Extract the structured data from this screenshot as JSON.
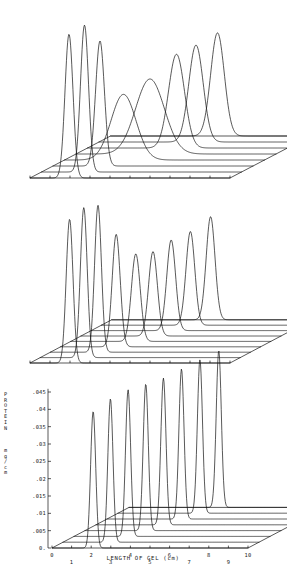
{
  "figure": {
    "background": "#ffffff",
    "line_color": "#111111",
    "panel_count": 3
  },
  "axes": {
    "x_title": "LENGTH OF GEL (cm)",
    "x_ticks": [
      "0",
      "1",
      "2",
      "3",
      "4",
      "5",
      "6",
      "7",
      "8",
      "9",
      "10"
    ],
    "x_range": [
      0,
      10
    ],
    "y_title_top": "PROTEIN",
    "y_title_bottom": "mg/cm",
    "y_title_letters_top": [
      "P",
      "R",
      "O",
      "T",
      "E",
      "I",
      "N"
    ],
    "y_title_letters_bottom": [
      "m",
      "g",
      "/",
      "c",
      "m"
    ],
    "y_ticks": [
      "0.",
      ".005",
      ".01",
      ".015",
      ".02",
      ".025",
      ".03",
      ".035",
      ".04",
      ".045"
    ],
    "y_range": [
      0,
      0.048
    ]
  },
  "chart_data": {
    "type": "line",
    "title": "",
    "subtitle": "",
    "xlabel": "LENGTH OF GEL (cm)",
    "ylabel": "PROTEIN mg/cm",
    "xlim": [
      0,
      10
    ],
    "ylim": [
      0,
      0.048
    ],
    "grid": false,
    "legend": "none",
    "projection": "waterfall-3d-offset-ridgeline",
    "panels": [
      {
        "name": "panel-top",
        "index": 0,
        "trace_count": 8,
        "axis_labels_shown": false,
        "description": "Eight offset profiles; first three sharp narrow peaks near 2.0-2.4 cm, middle traces broad low humps spreading 2.5-5 cm, last four progressively sharper peaks near 4.5-5.6 cm",
        "series": [
          {
            "name": "trace-1",
            "peaks": [
              {
                "x": 1.95,
                "height": 0.046,
                "width": 0.2
              }
            ]
          },
          {
            "name": "trace-2",
            "peaks": [
              {
                "x": 2.15,
                "height": 0.047,
                "width": 0.2
              }
            ]
          },
          {
            "name": "trace-3",
            "peaks": [
              {
                "x": 2.35,
                "height": 0.04,
                "width": 0.22
              }
            ]
          },
          {
            "name": "trace-4",
            "peaks": [
              {
                "x": 2.95,
                "height": 0.021,
                "width": 0.62
              }
            ]
          },
          {
            "name": "trace-5",
            "peaks": [
              {
                "x": 3.7,
                "height": 0.024,
                "width": 0.72
              }
            ]
          },
          {
            "name": "trace-6",
            "peaks": [
              {
                "x": 4.45,
                "height": 0.03,
                "width": 0.4
              }
            ]
          },
          {
            "name": "trace-7",
            "peaks": [
              {
                "x": 4.85,
                "height": 0.031,
                "width": 0.36
              }
            ]
          },
          {
            "name": "trace-8",
            "peaks": [
              {
                "x": 5.35,
                "height": 0.033,
                "width": 0.34
              }
            ]
          }
        ]
      },
      {
        "name": "panel-middle",
        "index": 1,
        "trace_count": 9,
        "axis_labels_shown": false,
        "description": "Nine offset profiles; three tall sharp peaks at 2.0-2.4 cm then descending series of medium peaks from 2.8 to 5.3 cm, each baseline with a step shoulder at the right",
        "series": [
          {
            "name": "trace-1",
            "peaks": [
              {
                "x": 1.98,
                "height": 0.046,
                "width": 0.17
              }
            ]
          },
          {
            "name": "trace-2",
            "peaks": [
              {
                "x": 2.18,
                "height": 0.048,
                "width": 0.17
              }
            ]
          },
          {
            "name": "trace-3",
            "peaks": [
              {
                "x": 2.38,
                "height": 0.047,
                "width": 0.17
              }
            ]
          },
          {
            "name": "trace-4",
            "peaks": [
              {
                "x": 2.78,
                "height": 0.036,
                "width": 0.2
              }
            ]
          },
          {
            "name": "trace-5",
            "peaks": [
              {
                "x": 3.25,
                "height": 0.028,
                "width": 0.22
              }
            ]
          },
          {
            "name": "trace-6",
            "peaks": [
              {
                "x": 3.6,
                "height": 0.027,
                "width": 0.22
              }
            ]
          },
          {
            "name": "trace-7",
            "peaks": [
              {
                "x": 4.0,
                "height": 0.029,
                "width": 0.22
              }
            ]
          },
          {
            "name": "trace-8",
            "peaks": [
              {
                "x": 4.45,
                "height": 0.03,
                "width": 0.22
              }
            ]
          },
          {
            "name": "trace-9",
            "peaks": [
              {
                "x": 4.95,
                "height": 0.033,
                "width": 0.22
              }
            ]
          }
        ]
      },
      {
        "name": "panel-bottom",
        "index": 2,
        "trace_count": 8,
        "axis_labels_shown": true,
        "description": "Eight offset profiles each with a single very sharp tall peak, positions stepping from about 2.1 to 4.6 cm, peak heights rising slightly across the series",
        "series": [
          {
            "name": "trace-1",
            "peaks": [
              {
                "x": 2.1,
                "height": 0.041,
                "width": 0.13
              }
            ]
          },
          {
            "name": "trace-2",
            "peaks": [
              {
                "x": 2.42,
                "height": 0.043,
                "width": 0.13
              }
            ]
          },
          {
            "name": "trace-3",
            "peaks": [
              {
                "x": 2.76,
                "height": 0.044,
                "width": 0.13
              }
            ]
          },
          {
            "name": "trace-4",
            "peaks": [
              {
                "x": 3.1,
                "height": 0.044,
                "width": 0.13
              }
            ]
          },
          {
            "name": "trace-5",
            "peaks": [
              {
                "x": 3.44,
                "height": 0.044,
                "width": 0.13
              }
            ]
          },
          {
            "name": "trace-6",
            "peaks": [
              {
                "x": 3.8,
                "height": 0.045,
                "width": 0.13
              }
            ]
          },
          {
            "name": "trace-7",
            "peaks": [
              {
                "x": 4.18,
                "height": 0.046,
                "width": 0.13
              }
            ]
          },
          {
            "name": "trace-8",
            "peaks": [
              {
                "x": 4.58,
                "height": 0.047,
                "width": 0.13
              }
            ]
          }
        ]
      }
    ]
  }
}
